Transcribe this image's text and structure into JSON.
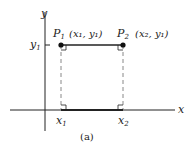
{
  "diagram": {
    "caption": "(a)",
    "axes": {
      "x_label": "x",
      "y_label": "y",
      "tick_y1": {
        "base": "y",
        "sub": "1"
      },
      "tick_x1": {
        "base": "x",
        "sub": "1"
      },
      "tick_x2": {
        "base": "x",
        "sub": "2"
      }
    },
    "points": [
      {
        "name_base": "P",
        "name_sub": "1",
        "coord_text": "(x₁, y₁)"
      },
      {
        "name_base": "P",
        "name_sub": "2",
        "coord_text": "(x₂, y₁)"
      }
    ],
    "colors": {
      "ink": "#222222",
      "dashed": "#888888",
      "background": "#ffffff"
    }
  }
}
